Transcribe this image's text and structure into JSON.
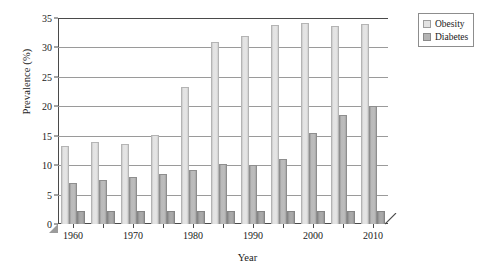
{
  "chart_data": {
    "type": "bar",
    "title": "",
    "xlabel": "Year",
    "ylabel": "Prevalence (%)",
    "categories": [
      1960,
      1965,
      1970,
      1975,
      1980,
      1985,
      1990,
      1995,
      2000,
      2005,
      2010
    ],
    "series": [
      {
        "name": "Obesity",
        "color": "#e3e3e3",
        "values": [
          13.3,
          13.9,
          13.6,
          15.1,
          23.3,
          31.0,
          32.0,
          33.8,
          34.2,
          33.7,
          33.9
        ]
      },
      {
        "name": "Diabetes",
        "color": "#b4b4b4",
        "values": [
          7.0,
          7.4,
          8.0,
          8.5,
          9.2,
          10.2,
          10.0,
          11.0,
          15.5,
          18.5,
          20.0
        ]
      },
      {
        "name": "baseline",
        "color": "#a8a8a8",
        "values": [
          2.2,
          2.2,
          2.2,
          2.2,
          2.2,
          2.2,
          2.2,
          2.2,
          2.2,
          2.2,
          2.2
        ]
      }
    ],
    "ylim": [
      0,
      35
    ],
    "yticks": [
      0,
      5,
      10,
      15,
      20,
      25,
      30,
      35
    ],
    "ytick_labels": [
      "0",
      "5",
      "10",
      "15",
      "20",
      "25",
      "30",
      "35"
    ],
    "xticks": [
      1960,
      1965,
      1970,
      1975,
      1980,
      1985,
      1990,
      1995,
      2000,
      2005,
      2010
    ],
    "xtick_labels": [
      "1960",
      "",
      "1970",
      "",
      "1980",
      "",
      "1990",
      "",
      "2000",
      "",
      "2010"
    ],
    "xlim": [
      1957.5,
      2012.5
    ],
    "grid": true,
    "grid_axis": "y",
    "legend_position": "right-outside",
    "legend_entries": [
      "Obesity",
      "Diabetes"
    ]
  },
  "legend": {
    "items": [
      {
        "label": "Obesity"
      },
      {
        "label": "Diabetes"
      }
    ]
  },
  "axes": {
    "y_title": "Prevalence (%)",
    "x_title": "Year"
  }
}
